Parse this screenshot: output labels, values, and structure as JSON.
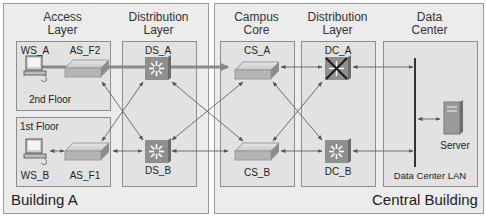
{
  "buildings": [
    {
      "name": "Building A"
    },
    {
      "name": "Central Building"
    }
  ],
  "layers": [
    {
      "title_line1": "Access",
      "title_line2": "Layer"
    },
    {
      "title_line1": "Distribution",
      "title_line2": "Layer"
    },
    {
      "title_line1": "Campus",
      "title_line2": "Core"
    },
    {
      "title_line1": "Distribution",
      "title_line2": "Layer"
    },
    {
      "title_line1": "Data",
      "title_line2": "Center"
    }
  ],
  "floors": {
    "upper": "2nd Floor",
    "lower": "1st Floor"
  },
  "devices": {
    "ws_a": "WS_A",
    "as_f2": "AS_F2",
    "ws_b": "WS_B",
    "as_f1": "AS_F1",
    "ds_a": "DS_A",
    "ds_b": "DS_B",
    "cs_a": "CS_A",
    "cs_b": "CS_B",
    "dc_a": "DC_A",
    "dc_b": "DC_B",
    "server": "Server",
    "lan": "Data Center LAN"
  },
  "colors": {
    "building_bg": "#ececec",
    "panel_bg": "#e2e2e2",
    "multilayer_switch": "#8f8f8f",
    "failed_mark": "#222222",
    "link": "#6e6e6e"
  }
}
